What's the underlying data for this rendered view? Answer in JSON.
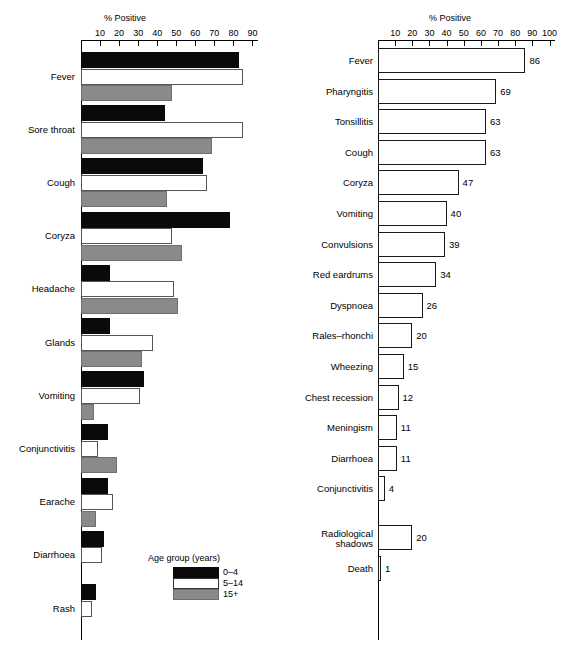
{
  "figure": {
    "background": "#ffffff",
    "colors": {
      "age_0_4": "#0a0a0a",
      "age_5_14": "#ffffff",
      "age_15_plus": "#8a8a8a",
      "outline": "#000000"
    }
  },
  "legend": {
    "title": "Age group (years)",
    "entries": [
      {
        "label": "0–4",
        "swatch": "black"
      },
      {
        "label": "5–14",
        "swatch": "white"
      },
      {
        "label": "15+",
        "swatch": "grey"
      }
    ]
  },
  "chart_data": [
    {
      "id": "left",
      "type": "bar",
      "orientation": "horizontal",
      "title": "",
      "xlabel": "% Positive",
      "ylabel": "",
      "xlim": [
        0,
        90
      ],
      "xticks": [
        10,
        20,
        30,
        40,
        50,
        60,
        70,
        80,
        90
      ],
      "grid": false,
      "legend_position": "bottom-right",
      "categories": [
        "Fever",
        "Sore throat",
        "Cough",
        "Coryza",
        "Headache",
        "Glands",
        "Vomiting",
        "Conjunctivitis",
        "Earache",
        "Diarrhoea",
        "Rash"
      ],
      "series": [
        {
          "name": "0–4",
          "values": [
            83,
            44,
            64,
            78,
            15,
            15,
            33,
            14,
            14,
            12,
            8
          ]
        },
        {
          "name": "5–14",
          "values": [
            85,
            85,
            66,
            48,
            49,
            38,
            31,
            9,
            17,
            11,
            6
          ]
        },
        {
          "name": "15+",
          "values": [
            48,
            69,
            45,
            53,
            51,
            32,
            7,
            19,
            8,
            0,
            0
          ]
        }
      ]
    },
    {
      "id": "right",
      "type": "bar",
      "orientation": "horizontal",
      "title": "",
      "xlabel": "% Positive",
      "ylabel": "",
      "xlim": [
        0,
        100
      ],
      "xticks": [
        10,
        20,
        30,
        40,
        50,
        60,
        70,
        80,
        90,
        100
      ],
      "grid": false,
      "categories": [
        "Fever",
        "Pharyngitis",
        "Tonsillitis",
        "Cough",
        "Coryza",
        "Vomiting",
        "Convulsions",
        "Red eardrums",
        "Dyspnoea",
        "Rales–rhonchi",
        "Wheezing",
        "Chest recession",
        "Meningism",
        "Diarrhoea",
        "Conjunctivitis",
        "Radiological shadows",
        "Death"
      ],
      "values": [
        86,
        69,
        63,
        63,
        47,
        40,
        39,
        34,
        26,
        20,
        15,
        12,
        11,
        11,
        4,
        20,
        1
      ],
      "value_labels": [
        "86",
        "69",
        "63",
        "63",
        "47",
        "40",
        "39",
        "34",
        "26",
        "20",
        "15",
        "12",
        "11",
        "11",
        "4",
        "20",
        "1"
      ]
    }
  ]
}
